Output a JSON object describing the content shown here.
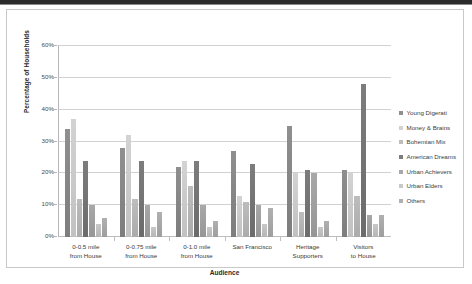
{
  "chart_data": {
    "type": "bar",
    "title": "",
    "xlabel": "Audience",
    "ylabel": "Percentage of Households",
    "ylim": [
      0,
      60
    ],
    "ytick_labels": [
      "60%",
      "50%",
      "40%",
      "30%",
      "20%",
      "10%",
      "0%"
    ],
    "ytick_values": [
      60,
      50,
      40,
      30,
      20,
      10,
      0
    ],
    "grid": true,
    "legend_position": "right",
    "categories": [
      "0-0.5 mile from House",
      "0-0.75 mile from House",
      "0-1.0 mile from House",
      "San Francisco",
      "Heritage Supporters",
      "Visitors to House"
    ],
    "category_lines": [
      [
        "0-0.5 mile",
        "from House"
      ],
      [
        "0-0.75 mile",
        "from House"
      ],
      [
        "0-1.0 mile",
        "from House"
      ],
      [
        "San Francisco",
        ""
      ],
      [
        "Heritage",
        "Supporters"
      ],
      [
        "Visitors",
        "to House"
      ]
    ],
    "series": [
      {
        "name": "Young Digerati",
        "color": "#8f8f8f",
        "values": [
          34,
          28,
          22,
          27,
          35,
          21
        ]
      },
      {
        "name": "Money & Brains",
        "color": "#d3d3d3",
        "values": [
          37,
          32,
          24,
          13,
          20,
          20
        ]
      },
      {
        "name": "Bohemian Mix",
        "color": "#bdbdbd",
        "values": [
          12,
          12,
          16,
          11,
          8,
          13
        ]
      },
      {
        "name": "American Dreams",
        "color": "#7d7d7d",
        "values": [
          24,
          24,
          24,
          23,
          21,
          48
        ]
      },
      {
        "name": "Urban Achievers",
        "color": "#a8a8a8",
        "values": [
          10,
          10,
          10,
          10,
          20,
          7
        ]
      },
      {
        "name": "Urban Elders",
        "color": "#c8c8c8",
        "values": [
          4,
          3,
          3,
          4,
          3,
          4
        ]
      },
      {
        "name": "Others",
        "color": "#b0b0b0",
        "values": [
          6,
          8,
          5,
          9,
          5,
          7
        ]
      }
    ]
  },
  "legend": {
    "items": [
      "Young Digerati",
      "Money & Brains",
      "Bohemian Mix",
      "American Dreams",
      "Urban Achievers",
      "Urban Elders",
      "Others"
    ]
  }
}
